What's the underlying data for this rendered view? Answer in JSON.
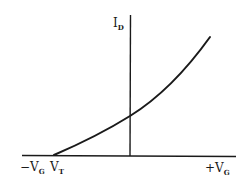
{
  "diagram": {
    "type": "transfer-characteristic",
    "colors": {
      "stroke": "#1a1a1a",
      "background": "#ffffff"
    },
    "axes": {
      "y_label": {
        "main": "I",
        "sub": "D"
      },
      "x_neg_label": {
        "main": "−V",
        "sub": "G"
      },
      "x_pos_label": {
        "main": "+V",
        "sub": "G"
      },
      "threshold_label": {
        "main": "V",
        "sub": "T"
      }
    },
    "curve": {
      "description": "Drain current rises from zero at threshold voltage V_T, increasing non-linearly as gate voltage increases",
      "start": "V_T",
      "shape": "quadratic"
    }
  }
}
